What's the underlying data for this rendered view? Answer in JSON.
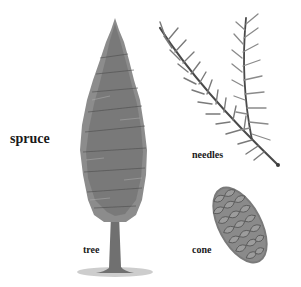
{
  "diagram": {
    "title": "spruce",
    "parts": [
      {
        "id": "tree",
        "label": "tree"
      },
      {
        "id": "needles",
        "label": "needles"
      },
      {
        "id": "cone",
        "label": "cone"
      }
    ]
  },
  "colors": {
    "background": "#ffffff",
    "text": "#1a1a1a",
    "foliage_dark": "#5a5a5a",
    "foliage_light": "#9a9a9a",
    "trunk": "#6b6b6b",
    "cone": "#7a7a7a"
  }
}
